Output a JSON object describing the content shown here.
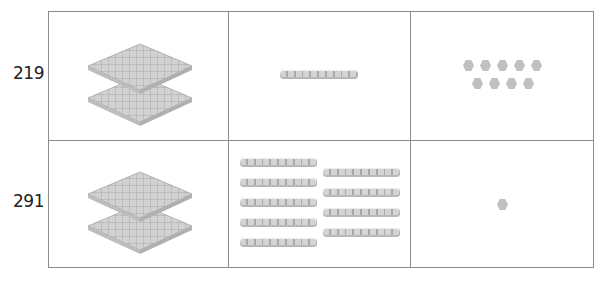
{
  "rows": [
    {
      "number": "219",
      "hundreds": 2,
      "tens": 1,
      "ones": 9
    },
    {
      "number": "291",
      "hundreds": 2,
      "tens": 9,
      "ones": 1
    }
  ],
  "columns": [
    "hundreds-flats",
    "tens-rods",
    "ones-units"
  ],
  "icons": {
    "hundred": "hundred-flat-block",
    "ten": "ten-rod-block",
    "one": "unit-cube"
  },
  "colors": {
    "border": "#8c8c8c",
    "block": "#cfcfcf",
    "block_shade": "#a9a9a9"
  }
}
